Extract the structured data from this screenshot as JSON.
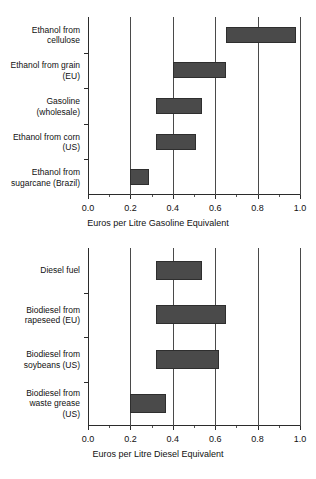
{
  "chart_data": [
    {
      "type": "bar",
      "orientation": "horizontal",
      "subtype": "range",
      "title": "",
      "xlabel": "Euros per Litre Gasoline Equivalent",
      "ylabel": "",
      "xlim": [
        0.0,
        1.0
      ],
      "grid": true,
      "legend": "none",
      "xticks": [
        "0.0",
        "0.2",
        "0.4",
        "0.6",
        "0.8",
        "1.0"
      ],
      "xtick_values": [
        0.0,
        0.2,
        0.4,
        0.6,
        0.8,
        1.0
      ],
      "categories": [
        "Ethanol from\ncellulose",
        "Ethanol from grain\n(EU)",
        "Gasoline\n(wholesale)",
        "Ethanol from corn\n(US)",
        "Ethanol from\nsugarcane (Brazil)"
      ],
      "ranges": [
        {
          "label": "Ethanol from cellulose",
          "low": 0.65,
          "high": 0.98
        },
        {
          "label": "Ethanol from grain (EU)",
          "low": 0.4,
          "high": 0.65
        },
        {
          "label": "Gasoline (wholesale)",
          "low": 0.32,
          "high": 0.54
        },
        {
          "label": "Ethanol from corn (US)",
          "low": 0.32,
          "high": 0.51
        },
        {
          "label": "Ethanol from sugarcane (Brazil)",
          "low": 0.2,
          "high": 0.29
        }
      ]
    },
    {
      "type": "bar",
      "orientation": "horizontal",
      "subtype": "range",
      "title": "",
      "xlabel": "Euros per Litre Diesel Equivalent",
      "ylabel": "",
      "xlim": [
        0.0,
        1.0
      ],
      "grid": true,
      "legend": "none",
      "xticks": [
        "0.0",
        "0.2",
        "0.4",
        "0.6",
        "0.8",
        "1.0"
      ],
      "xtick_values": [
        0.0,
        0.2,
        0.4,
        0.6,
        0.8,
        1.0
      ],
      "categories": [
        "Diesel fuel",
        "Biodiesel from\nrapeseed (EU)",
        "Biodiesel from\nsoybeans (US)",
        "Biodiesel from\nwaste grease\n(US)"
      ],
      "ranges": [
        {
          "label": "Diesel fuel",
          "low": 0.32,
          "high": 0.54
        },
        {
          "label": "Biodiesel from rapeseed (EU)",
          "low": 0.32,
          "high": 0.65
        },
        {
          "label": "Biodiesel from soybeans (US)",
          "low": 0.32,
          "high": 0.62
        },
        {
          "label": "Biodiesel from waste grease (US)",
          "low": 0.2,
          "high": 0.37
        }
      ]
    }
  ],
  "colors": {
    "bar_fill": "#4a4a4a",
    "bar_stroke": "#2e2e2e",
    "axis": "#2b2b2b",
    "grid": "#4a4a4a",
    "text": "#111111",
    "background": "#ffffff"
  }
}
